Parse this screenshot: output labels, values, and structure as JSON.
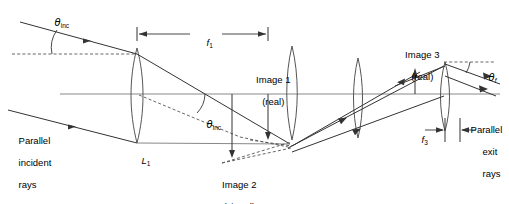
{
  "figure": {
    "domain": "diagram",
    "width": 509,
    "height": 204,
    "background_color": "#ffffff",
    "line_color": "#4d4d4d",
    "ray_color": "#333333",
    "text_color": "#000000"
  },
  "labels": {
    "theta_inc_top": "θ",
    "theta_inc_top_sub": "inc",
    "theta_inc_axis": "θ",
    "theta_inc_axis_sub": "inc",
    "theta_f": "θ",
    "theta_f_sub": "f",
    "f1": "f",
    "f1_sub": "1",
    "f3": "f",
    "f3_sub": "3",
    "lens1": "L",
    "lens1_sub": "1",
    "image1_line1": "Image 1",
    "image1_line2": "(real)",
    "image2_line1": "Image 2",
    "image2_line2": "(virtual)",
    "image3_line1": "Image 3",
    "image3_line2": "(real)",
    "parallel_incident_line1": "Parallel",
    "parallel_incident_line2": "incident",
    "parallel_incident_line3": "rays",
    "parallel_exit_line1": "Parallel",
    "parallel_exit_line2": "exit",
    "parallel_exit_line3": "rays"
  },
  "geometry": {
    "optical_axis_y": 94,
    "optical_axis_x_start": 60,
    "optical_axis_x_end": 500,
    "lens_positions_x": [
      137,
      292,
      358,
      445
    ],
    "dashed_reference_y": 54,
    "f1_span_x": [
      137,
      268
    ],
    "f3_span_x": [
      412,
      445
    ]
  }
}
